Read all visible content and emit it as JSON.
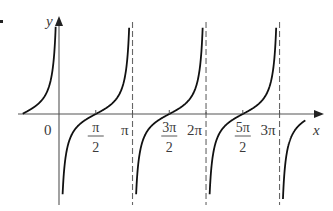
{
  "chart_data": {
    "type": "line",
    "title": "",
    "function": "y = -cot(x)",
    "xlabel": "x",
    "ylabel": "y",
    "origin_label": "0",
    "x_ticks": [
      {
        "value": 1.5708,
        "num": "π",
        "den": "2"
      },
      {
        "value": 3.1416,
        "label": "π"
      },
      {
        "value": 4.7124,
        "num": "3π",
        "den": "2"
      },
      {
        "value": 6.2832,
        "label": "2π"
      },
      {
        "value": 7.854,
        "num": "5π",
        "den": "2"
      },
      {
        "value": 9.4248,
        "label": "3π"
      }
    ],
    "asymptotes": [
      {
        "x": 3.1416,
        "style": "dashed"
      },
      {
        "x": 6.2832,
        "style": "dashed"
      },
      {
        "x": 9.4248,
        "style": "dashed"
      }
    ],
    "zeros": [
      1.5708,
      4.7124,
      7.854
    ],
    "xlim": [
      -1.1,
      10.3
    ],
    "ylim": [
      -6,
      6
    ],
    "grid": false,
    "legend": null,
    "colors": {
      "curve": "#111111",
      "axis": "#555555",
      "asymptote": "#666666"
    }
  },
  "layout": {
    "origin_px": [
      59,
      114
    ],
    "px_per_unit_x": 23.4,
    "px_per_unit_y": 12.5,
    "y_top_px": 25,
    "y_bottom_px": 200
  }
}
